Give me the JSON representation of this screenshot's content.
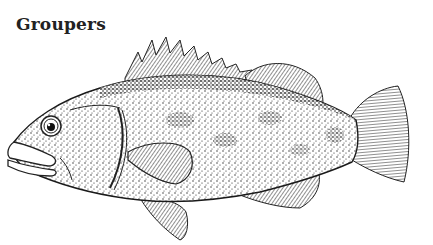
{
  "title": "Groupers",
  "illustration": {
    "subject": "grouper fish",
    "style": "black and white stipple ink drawing",
    "facing": "left",
    "ink_color": "#1a1a1a",
    "background_color": "#ffffff"
  }
}
